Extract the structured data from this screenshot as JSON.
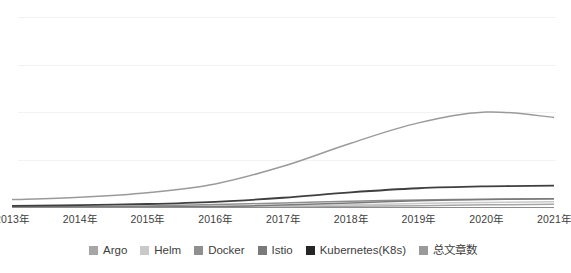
{
  "chart_data": {
    "type": "line",
    "title": "",
    "subtitle": "",
    "xlabel": "",
    "ylabel": "",
    "grid": true,
    "legend_position": "bottom",
    "categories": [
      "2013年",
      "2014年",
      "2015年",
      "2016年",
      "2017年",
      "2018年",
      "2019年",
      "2020年",
      "2021年"
    ],
    "x": [
      2013,
      2014,
      2015,
      2016,
      2017,
      2018,
      2019,
      2020,
      2021
    ],
    "ylim": [
      0,
      1400
    ],
    "y_gridlines": [
      350,
      700,
      1050,
      1400
    ],
    "series": [
      {
        "name": "Argo",
        "color": "#a6a6a6",
        "values": [
          0,
          0,
          0,
          0,
          2,
          5,
          10,
          16,
          20
        ]
      },
      {
        "name": "Helm",
        "color": "#c9c9c9",
        "values": [
          0,
          0,
          1,
          3,
          8,
          16,
          26,
          34,
          38
        ]
      },
      {
        "name": "Docker",
        "color": "#8f8f8f",
        "values": [
          0,
          2,
          8,
          18,
          30,
          42,
          52,
          58,
          60
        ]
      },
      {
        "name": "Istio",
        "color": "#7a7a7a",
        "values": [
          0,
          0,
          0,
          4,
          14,
          30,
          46,
          56,
          60
        ]
      },
      {
        "name": "Kubernetes(K8s)",
        "color": "#3f3f3f",
        "values": [
          8,
          14,
          22,
          38,
          68,
          108,
          138,
          152,
          158
        ]
      },
      {
        "name": "总文章数",
        "color": "#9a9a9a",
        "values": [
          55,
          72,
          105,
          170,
          300,
          470,
          620,
          700,
          660
        ]
      }
    ],
    "top_series_name": "总文章数",
    "peak_category": "2020年",
    "peak_value": 700
  },
  "legend": {
    "items": [
      {
        "label": "Argo",
        "color": "#a6a6a6"
      },
      {
        "label": "Helm",
        "color": "#c9c9c9"
      },
      {
        "label": "Docker",
        "color": "#8f8f8f"
      },
      {
        "label": "Istio",
        "color": "#7a7a7a"
      },
      {
        "label": "Kubernetes(K8s)",
        "color": "#262626"
      },
      {
        "label": "总文章数",
        "color": "#9a9a9a"
      }
    ]
  },
  "axis": {
    "tick_labels": [
      "2013年",
      "2014年",
      "2015年",
      "2016年",
      "2017年",
      "2018年",
      "2019年",
      "2020年",
      "2021年"
    ],
    "axis_color": "#8c8c8c",
    "grid_color": "#f2f2f2"
  }
}
